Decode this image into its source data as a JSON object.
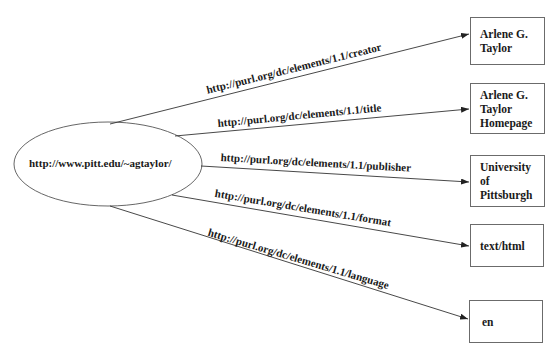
{
  "diagram": {
    "type": "RDF graph",
    "subject": {
      "label": "http://www.pitt.edu/~agtaylor/",
      "shape": "ellipse"
    },
    "edges": [
      {
        "predicate": "http://purl.org/dc/elements/1.1/creator",
        "object": "Arlene G. Taylor"
      },
      {
        "predicate": "http://purl.org/dc/elements/1.1/title",
        "object": "Arlene G. Taylor Homepage"
      },
      {
        "predicate": "http://purl.org/dc/elements/1.1/publisher",
        "object": "University of Pittsburgh"
      },
      {
        "predicate": "http://purl.org/dc/elements/1.1/format",
        "object": "text/html"
      },
      {
        "predicate": "http://purl.org/dc/elements/1.1/language",
        "object": "en"
      }
    ],
    "objects": [
      {
        "lines": [
          "Arlene G.",
          "Taylor"
        ]
      },
      {
        "lines": [
          "Arlene G.",
          "Taylor",
          "Homepage"
        ]
      },
      {
        "lines": [
          "University",
          "of",
          "Pittsburgh"
        ]
      },
      {
        "lines": [
          "text/html"
        ]
      },
      {
        "lines": [
          "en"
        ]
      }
    ],
    "colors": {
      "line": "#333333",
      "box_border": "#6b6b6b",
      "text": "#1a1a1a",
      "background": "#ffffff"
    }
  }
}
